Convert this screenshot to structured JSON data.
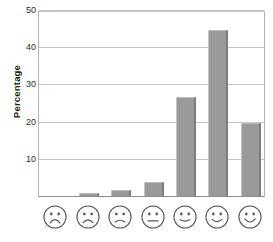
{
  "chart_data": {
    "type": "bar",
    "title": "",
    "xlabel": "",
    "ylabel": "Percentage",
    "ylim": [
      0,
      50
    ],
    "yticks": [
      10,
      20,
      30,
      40,
      50
    ],
    "ytick_labels": [
      "10",
      "20",
      "30",
      "40",
      "50"
    ],
    "grid": true,
    "legend": "none",
    "categories": [
      "very-sad-face",
      "sad-face",
      "slightly-sad-face",
      "neutral-face",
      "slightly-happy-face",
      "happy-face",
      "very-happy-face"
    ],
    "category_labels": [
      "face-1-frowning",
      "face-2-frowning",
      "face-3-slight-frown",
      "face-4-neutral",
      "face-5-slight-smile",
      "face-6-smiling",
      "face-7-big-smile"
    ],
    "values": [
      0,
      1,
      2,
      4,
      27,
      45,
      20
    ],
    "bar_color": "#9a9a9a",
    "grid_color": "#c4c4c4",
    "axis_color": "#b4b4b4"
  },
  "axis": {
    "y_title": "Percentage",
    "ticks": [
      {
        "label": "50",
        "value": 50
      },
      {
        "label": "40",
        "value": 40
      },
      {
        "label": "30",
        "value": 30
      },
      {
        "label": "20",
        "value": 20
      },
      {
        "label": "10",
        "value": 10
      }
    ]
  },
  "faces": [
    {
      "name": "very-sad-face",
      "mouth": "frown-deep",
      "value": 0
    },
    {
      "name": "sad-face",
      "mouth": "frown",
      "value": 1
    },
    {
      "name": "slightly-sad-face",
      "mouth": "frown-slight",
      "value": 2
    },
    {
      "name": "neutral-face",
      "mouth": "flat",
      "value": 4
    },
    {
      "name": "slightly-happy-face",
      "mouth": "smile-slight",
      "value": 27
    },
    {
      "name": "happy-face",
      "mouth": "smile",
      "value": 45
    },
    {
      "name": "very-happy-face",
      "mouth": "smile-big",
      "value": 20
    }
  ]
}
